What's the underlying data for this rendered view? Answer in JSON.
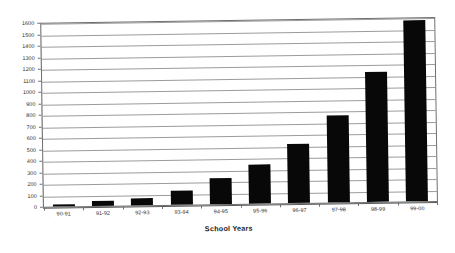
{
  "chart_data": {
    "type": "bar",
    "title": "",
    "subtitle": "",
    "xlabel": "School Years",
    "ylabel": "",
    "categories": [
      "90-91",
      "91-92",
      "92-93",
      "93-94",
      "94-95",
      "95-96",
      "96-97",
      "97-98",
      "98-99",
      "99-00"
    ],
    "values": [
      20,
      40,
      65,
      125,
      230,
      340,
      510,
      760,
      1130,
      1570
    ],
    "series": [
      {
        "name": "",
        "values": [
          20,
          40,
          65,
          125,
          230,
          340,
          510,
          760,
          1130,
          1570
        ]
      }
    ],
    "ylim": [
      0,
      1600
    ],
    "ytick_step": 100,
    "ytick_labels": [
      "0",
      "100",
      "200",
      "300",
      "400",
      "500",
      "600",
      "700",
      "800",
      "900",
      "1000",
      "1100",
      "1200",
      "1300",
      "1400",
      "1500",
      "1600"
    ],
    "grid": true,
    "grid_axis": "y",
    "legend": false,
    "legend_position": "none",
    "bar_color": "#080808",
    "grid_color": "#8a8a8a",
    "axis_color": "#6f6f6f",
    "background_color": "#ffffff"
  }
}
